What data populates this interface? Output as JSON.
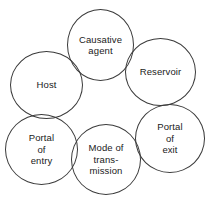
{
  "diagram": {
    "type": "overlapping-circle-cycle",
    "background_color": "#ffffff",
    "stroke_color": "#3a3a3a",
    "text_color": "#1a1a1a",
    "nodes": [
      {
        "id": "causative-agent",
        "label": "Causative\nagent",
        "position": "top-center"
      },
      {
        "id": "reservoir",
        "label": "Reservoir",
        "position": "upper-right"
      },
      {
        "id": "host",
        "label": "Host",
        "position": "upper-left"
      },
      {
        "id": "portal-of-exit",
        "label": "Portal\nof\nexit",
        "position": "lower-right"
      },
      {
        "id": "portal-of-entry",
        "label": "Portal\nof\nentry",
        "position": "lower-left"
      },
      {
        "id": "mode-of-transmission",
        "label": "Mode of\ntrans-\nmission",
        "position": "bottom-center"
      }
    ]
  }
}
